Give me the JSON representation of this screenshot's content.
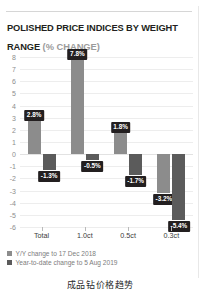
{
  "header": {
    "title": "POLISHED PRICE INDICES BY WEIGHT RANGE ",
    "subtitle": "(% CHANGE)"
  },
  "caption": "成品钻价格趋势",
  "legend": {
    "items": [
      {
        "label": "Y/Y change to 17 Dec 2018",
        "color": "#8c8c8c"
      },
      {
        "label": "Year-to-date change to 5 Aug 2019",
        "color": "#5b5b5b"
      }
    ]
  },
  "chart_data": {
    "type": "bar",
    "title": "POLISHED PRICE INDICES BY WEIGHT RANGE (% CHANGE)",
    "xlabel": "",
    "ylabel": "",
    "ylim": [
      -6,
      8
    ],
    "yticks": [
      8,
      7,
      6,
      5,
      4,
      3,
      2,
      1,
      0,
      -1,
      -2,
      -3,
      -4,
      -5,
      -6
    ],
    "ytick_labels": [
      "8",
      "7",
      "6",
      "5",
      "4",
      "3",
      "2",
      "1",
      "0",
      "-1",
      "-2",
      "-3",
      "-4",
      "-5",
      "-6"
    ],
    "categories": [
      "Total",
      "1.0ct",
      "0.5ct",
      "0.3ct"
    ],
    "grid": true,
    "legend_position": "bottom-left",
    "series": [
      {
        "name": "Y/Y change to 17 Dec 2018",
        "color": "#8c8c8c",
        "values": [
          2.8,
          7.8,
          1.8,
          -3.2
        ],
        "labels": [
          "2.8%",
          "7.8%",
          "1.8%",
          "-3.2%"
        ]
      },
      {
        "name": "Year-to-date change to 5 Aug 2019",
        "color": "#5b5b5b",
        "values": [
          -1.3,
          -0.5,
          -1.7,
          -5.4
        ],
        "labels": [
          "-1.3%",
          "-0.5%",
          "-1.7%",
          "-5.4%"
        ]
      }
    ]
  }
}
